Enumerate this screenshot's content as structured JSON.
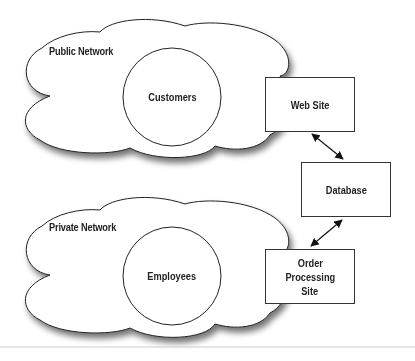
{
  "diagram": {
    "clouds": [
      {
        "id": "public",
        "label": "Public Network",
        "inner": "Customers"
      },
      {
        "id": "private",
        "label": "Private Network",
        "inner": "Employees"
      }
    ],
    "boxes": {
      "web_site": "Web Site",
      "database": "Database",
      "order_l1": "Order",
      "order_l2": "Processing",
      "order_l3": "Site"
    },
    "connections": [
      {
        "from": "Web Site",
        "to": "Database",
        "type": "bidirectional"
      },
      {
        "from": "Database",
        "to": "Order Processing Site",
        "type": "bidirectional"
      }
    ],
    "colors": {
      "stroke": "#333333",
      "text": "#222222",
      "background": "#ffffff"
    }
  }
}
